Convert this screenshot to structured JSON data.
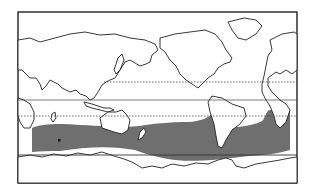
{
  "map": {
    "projection": "pacific-centered world outline",
    "frame": {
      "x": 18,
      "y": 12,
      "w": 279,
      "h": 171
    },
    "colors": {
      "background": "#ffffff",
      "outline": "#222222",
      "band": "#6f6f6f",
      "land": "#ffffff"
    },
    "reference_lines": [
      {
        "name": "dotted-line-north",
        "y": 82,
        "x1": 104,
        "x2": 297,
        "style": "dotted"
      },
      {
        "name": "solid-line-equator",
        "y": 100,
        "x1": 18,
        "x2": 297,
        "style": "solid"
      },
      {
        "name": "dotted-line-south",
        "y": 116,
        "x1": 18,
        "x2": 297,
        "style": "dotted"
      },
      {
        "name": "solid-line-southern",
        "y": 155,
        "x1": 18,
        "x2": 297,
        "style": "solid"
      }
    ],
    "shaded_region": {
      "name": "southern-ocean-band",
      "description": "gray band spanning the southern oceans",
      "x_start": 32,
      "x_end": 290
    },
    "markers": [
      {
        "name": "small-dot-marker",
        "x": 59,
        "y": 140
      }
    ]
  }
}
